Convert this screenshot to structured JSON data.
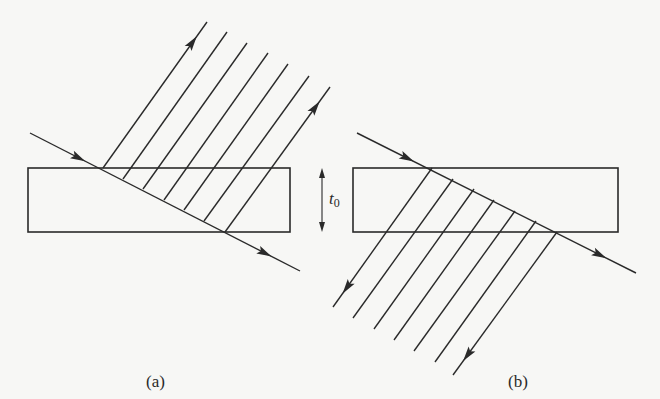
{
  "figure": {
    "panels": [
      {
        "id": "a",
        "label": "(a)",
        "description": "Incident ray refracts into slab; multiply reflected rays exit back through the top surface (reflected set)",
        "slab": {
          "x": 28,
          "y": 168,
          "width": 262,
          "height": 64
        },
        "incident_ray": {
          "start": [
            30,
            133
          ],
          "entry": [
            103,
            168
          ],
          "exit": [
            225,
            232
          ],
          "end": [
            300,
            271
          ]
        },
        "ray_count": 7,
        "ray_direction": "up-right",
        "ray_origins": [
          [
            103,
            168
          ],
          [
            123,
            179
          ],
          [
            143,
            189
          ],
          [
            164,
            200
          ],
          [
            184,
            210
          ],
          [
            204,
            221
          ],
          [
            225,
            232
          ]
        ],
        "ray_ends": [
          [
            207,
            22
          ],
          [
            227,
            32
          ],
          [
            247,
            43
          ],
          [
            268,
            53
          ],
          [
            288,
            64
          ],
          [
            309,
            76
          ],
          [
            330,
            87
          ]
        ],
        "arrowed_rays": [
          0,
          6
        ]
      },
      {
        "id": "b",
        "label": "(b)",
        "description": "Incident ray refracts into slab; multiply transmitted rays exit through the bottom surface (transmitted set)",
        "slab": {
          "x": 353,
          "y": 168,
          "width": 265,
          "height": 64
        },
        "incident_ray": {
          "start": [
            357,
            133
          ],
          "entry": [
            432,
            168
          ],
          "exit": [
            557,
            232
          ],
          "end": [
            636,
            273
          ]
        },
        "ray_count": 7,
        "ray_direction": "down-left",
        "ray_origins": [
          [
            432,
            168
          ],
          [
            453,
            179
          ],
          [
            474,
            189
          ],
          [
            494,
            200
          ],
          [
            515,
            211
          ],
          [
            536,
            221
          ],
          [
            557,
            232
          ]
        ],
        "ray_ends": [
          [
            333,
            307
          ],
          [
            353,
            318
          ],
          [
            374,
            329
          ],
          [
            394,
            340
          ],
          [
            414,
            351
          ],
          [
            435,
            362
          ],
          [
            453,
            375
          ]
        ],
        "arrowed_rays": [
          0,
          6
        ]
      }
    ],
    "thickness_marker": {
      "symbol": "t",
      "subscript": "0",
      "x": 322,
      "top": 168,
      "bottom": 232
    },
    "colors": {
      "ink": "#2a2a2a",
      "paper": "#f7f7f5"
    }
  }
}
